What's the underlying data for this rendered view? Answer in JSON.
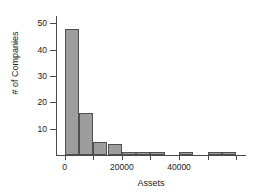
{
  "chart_data": {
    "type": "bar",
    "title": "",
    "xlabel": "Assets",
    "ylabel": "# of Companies",
    "bin_width": 5000,
    "bin_starts": [
      0,
      5000,
      10000,
      15000,
      20000,
      25000,
      30000,
      35000,
      40000,
      45000,
      50000,
      55000
    ],
    "categories": [
      "0-5000",
      "5000-10000",
      "10000-15000",
      "15000-20000",
      "20000-25000",
      "25000-30000",
      "30000-35000",
      "35000-40000",
      "40000-45000",
      "45000-50000",
      "50000-55000",
      "55000-60000"
    ],
    "values": [
      48,
      16,
      5,
      4,
      1,
      1,
      1,
      0,
      1,
      0,
      1,
      1
    ],
    "xlim": [
      -3000,
      62000
    ],
    "ylim": [
      0,
      52
    ],
    "xticks": [
      0,
      20000,
      40000
    ],
    "xtick_labels": [
      "0",
      "20000",
      "40000"
    ],
    "xminor_ticks": [
      10000,
      30000,
      50000,
      60000
    ],
    "yticks": [
      10,
      20,
      30,
      40,
      50
    ],
    "ytick_labels": [
      "10",
      "20",
      "30",
      "40",
      "50"
    ],
    "grid": false,
    "legend": false,
    "bar_color": "#9d9d9d",
    "bar_edge_color": "#4f4f4f",
    "axis_color": "#4a4a4a"
  }
}
